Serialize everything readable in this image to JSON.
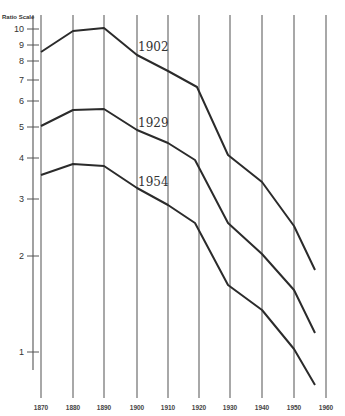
{
  "chart_data": {
    "type": "line",
    "title": "",
    "ylabel": "Ratio Scale",
    "xlabel": "",
    "yscale": "log",
    "ylim": [
      1,
      10
    ],
    "yticks": [
      1,
      2,
      3,
      4,
      5,
      6,
      7,
      8,
      9,
      10
    ],
    "x": [
      1870,
      1880,
      1890,
      1900,
      1910,
      1920,
      1930,
      1940,
      1950,
      1956
    ],
    "xticks": [
      "1870",
      "1880",
      "1890",
      "1900",
      "1910",
      "1920",
      "1930",
      "1940",
      "1950",
      "1960"
    ],
    "grid": "vertical lines at each decade",
    "legend": "inline labels",
    "series": [
      {
        "name": "1902",
        "values": [
          8.6,
          9.9,
          10.1,
          8.4,
          7.5,
          6.7,
          4.1,
          3.4,
          2.5,
          1.8
        ]
      },
      {
        "name": "1929",
        "values": [
          5.1,
          5.6,
          5.7,
          4.9,
          4.4,
          3.9,
          2.5,
          2.0,
          1.55,
          1.15
        ]
      },
      {
        "name": "1954",
        "values": [
          3.6,
          3.8,
          3.8,
          3.2,
          2.9,
          2.5,
          1.6,
          1.35,
          1.0,
          0.78
        ]
      }
    ]
  },
  "axis": {
    "title": "Ratio Scale",
    "y_ticks": [
      {
        "label": "10",
        "y": 29
      },
      {
        "label": "9",
        "y": 45
      },
      {
        "label": "8",
        "y": 61
      },
      {
        "label": "7",
        "y": 80
      },
      {
        "label": "6",
        "y": 101
      },
      {
        "label": "5",
        "y": 127
      },
      {
        "label": "4",
        "y": 158
      },
      {
        "label": "3",
        "y": 199
      },
      {
        "label": "2",
        "y": 256
      },
      {
        "label": "1",
        "y": 352
      }
    ],
    "x_ticks": [
      {
        "label": "1870",
        "x": 41
      },
      {
        "label": "1880",
        "x": 73
      },
      {
        "label": "1890",
        "x": 104
      },
      {
        "label": "1900",
        "x": 137
      },
      {
        "label": "1910",
        "x": 168
      },
      {
        "label": "1920",
        "x": 199
      },
      {
        "label": "1930",
        "x": 230
      },
      {
        "label": "1940",
        "x": 262
      },
      {
        "label": "1950",
        "x": 294
      },
      {
        "label": "1960",
        "x": 326
      }
    ]
  },
  "series_labels": [
    {
      "text": "1902",
      "x": 138,
      "y": 51
    },
    {
      "text": "1929",
      "x": 138,
      "y": 127
    },
    {
      "text": "1954",
      "x": 138,
      "y": 186
    }
  ],
  "series_paths": [
    "41,52 73,31 104,28 137,55 168,71 197,87 228,155 262,182 294,226 315,270",
    "41,126 73,110 104,109 137,130 168,143 195,160 228,223 262,254 294,290 315,333",
    "41,175 73,164 104,166 137,188 168,205 195,223 228,285 262,310 294,349 315,385"
  ]
}
